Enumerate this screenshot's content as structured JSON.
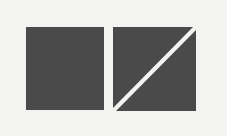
{
  "background_color": "#f3f3f1",
  "shapes": [
    {
      "id": "solid-square",
      "type": "square",
      "x": 26,
      "y": 27,
      "width": 78,
      "height": 83,
      "fill": "#4a4a4a",
      "divided": false
    },
    {
      "id": "divided-square",
      "type": "square",
      "x": 113,
      "y": 27,
      "width": 83,
      "height": 84,
      "fill": "#4a4a4a",
      "divided": true,
      "divider": {
        "from": "bottom-left",
        "to": "top-right",
        "color": "#f3f3f1",
        "stroke_width": 3
      }
    }
  ]
}
